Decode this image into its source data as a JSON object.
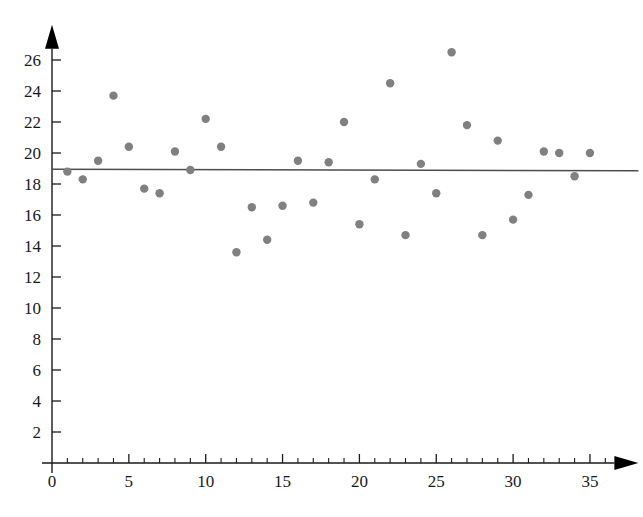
{
  "chart_data": {
    "type": "scatter",
    "title": "",
    "xlabel": "",
    "ylabel": "",
    "xlim": [
      0,
      37.5
    ],
    "ylim": [
      0,
      27.5
    ],
    "grid": false,
    "legend": "none",
    "x_ticks_major": [
      0,
      5,
      10,
      15,
      20,
      25,
      30,
      35
    ],
    "x_tick_labels": [
      "0",
      "5",
      "10",
      "15",
      "20",
      "25",
      "30",
      "35"
    ],
    "x_tick_minor_step": 1,
    "y_ticks_major": [
      2,
      4,
      6,
      8,
      10,
      12,
      14,
      16,
      18,
      20,
      22,
      24,
      26
    ],
    "y_tick_labels": [
      "2",
      "4",
      "6",
      "8",
      "10",
      "12",
      "14",
      "16",
      "18",
      "20",
      "22",
      "24",
      "26"
    ],
    "point_color": "#808080",
    "point_radius": 4.2,
    "x": [
      1,
      2,
      3,
      4,
      5,
      6,
      7,
      8,
      9,
      10,
      11,
      12,
      13,
      14,
      15,
      16,
      17,
      18,
      19,
      20,
      21,
      22,
      23,
      24,
      25,
      26,
      27,
      28,
      29,
      30,
      31,
      32,
      33,
      34,
      35
    ],
    "y": [
      18.8,
      18.3,
      19.5,
      23.7,
      20.4,
      17.7,
      17.4,
      20.1,
      18.9,
      22.2,
      20.4,
      13.6,
      16.5,
      14.4,
      16.6,
      19.5,
      16.8,
      19.4,
      22.0,
      15.4,
      18.3,
      24.5,
      14.7,
      19.3,
      17.4,
      26.5,
      21.8,
      14.7,
      20.8,
      15.7,
      17.3,
      20.1,
      20.0,
      18.5,
      20.0
    ],
    "series": [
      {
        "name": "observations",
        "type": "scatter",
        "points": [
          {
            "x": 1,
            "y": 18.8
          },
          {
            "x": 2,
            "y": 18.3
          },
          {
            "x": 3,
            "y": 19.5
          },
          {
            "x": 4,
            "y": 23.7
          },
          {
            "x": 5,
            "y": 20.4
          },
          {
            "x": 6,
            "y": 17.7
          },
          {
            "x": 7,
            "y": 17.4
          },
          {
            "x": 8,
            "y": 20.1
          },
          {
            "x": 9,
            "y": 18.9
          },
          {
            "x": 10,
            "y": 22.2
          },
          {
            "x": 11,
            "y": 20.4
          },
          {
            "x": 12,
            "y": 13.6
          },
          {
            "x": 13,
            "y": 16.5
          },
          {
            "x": 14,
            "y": 14.4
          },
          {
            "x": 15,
            "y": 16.6
          },
          {
            "x": 16,
            "y": 19.5
          },
          {
            "x": 17,
            "y": 16.8
          },
          {
            "x": 18,
            "y": 19.4
          },
          {
            "x": 19,
            "y": 22.0
          },
          {
            "x": 20,
            "y": 15.4
          },
          {
            "x": 21,
            "y": 18.3
          },
          {
            "x": 22,
            "y": 24.5
          },
          {
            "x": 23,
            "y": 14.7
          },
          {
            "x": 24,
            "y": 19.3
          },
          {
            "x": 25,
            "y": 17.4
          },
          {
            "x": 26,
            "y": 26.5
          },
          {
            "x": 27,
            "y": 21.8
          },
          {
            "x": 28,
            "y": 14.7
          },
          {
            "x": 29,
            "y": 20.8
          },
          {
            "x": 30,
            "y": 15.7
          },
          {
            "x": 31,
            "y": 17.3
          },
          {
            "x": 32,
            "y": 20.1
          },
          {
            "x": 33,
            "y": 20.0
          },
          {
            "x": 34,
            "y": 18.5
          },
          {
            "x": 35,
            "y": 20.0
          }
        ]
      },
      {
        "name": "fit-line",
        "type": "line",
        "color": "#4d4d4d",
        "x_start": 0,
        "y_start": 18.95,
        "x_end": 37.5,
        "y_end": 18.85
      }
    ]
  }
}
